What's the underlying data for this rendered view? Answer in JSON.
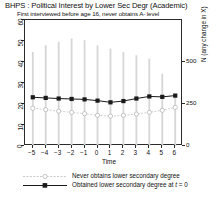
{
  "chart_data": {
    "type": "line",
    "title": "BHPS : Political Interest by Lower Sec Degr (Academic)",
    "subtitle": "First interviewed before age 16, never obtains A- level",
    "xlabel": "Time",
    "ylabel": "",
    "y2label": "N (any change in X)",
    "x": [
      -5,
      -4,
      -3,
      -2,
      -1,
      0,
      1,
      2,
      3,
      4,
      5,
      6
    ],
    "xlim": [
      -5.6,
      6.6
    ],
    "ylim": [
      0,
      60
    ],
    "yticks": [
      0,
      10,
      20,
      30,
      40,
      50,
      60
    ],
    "y2lim": [
      0,
      750
    ],
    "y2ticks": [
      0,
      250,
      500
    ],
    "grid": false,
    "legend_position": "below",
    "series": [
      {
        "name": "Never obtains lower secondary degree",
        "marker": "open-circle",
        "color": "#c9c9c9",
        "values": [
          18.0,
          17.3,
          16.6,
          16.0,
          15.4,
          14.6,
          14.2,
          14.6,
          15.2,
          16.0,
          17.0,
          18.4
        ]
      },
      {
        "name": "Obtained lower secondary degree at t = 0",
        "marker": "filled-square",
        "color": "#1a1a1a",
        "values": [
          23.2,
          22.9,
          22.6,
          22.4,
          22.2,
          21.6,
          20.8,
          21.4,
          22.6,
          23.6,
          23.4,
          24.0
        ]
      }
    ],
    "bars": {
      "name": "N (any change in X)",
      "color": "#d6d6d6",
      "values": [
        560,
        600,
        620,
        640,
        630,
        600,
        580,
        560,
        540,
        520,
        430,
        300
      ]
    }
  },
  "legend": {
    "entries": [
      {
        "label": "Never obtains lower secondary degree",
        "label_italic_part": "",
        "marker": "open-circle"
      },
      {
        "label": "Obtained lower secondary degree at ",
        "label_italic_part": "t",
        "label_tail": " = 0",
        "marker": "filled-square"
      }
    ]
  }
}
